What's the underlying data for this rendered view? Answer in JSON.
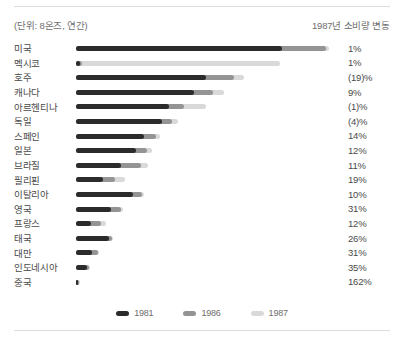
{
  "header": {
    "unit_note": "(단위: 8온즈, 연간)",
    "change_note": "1987년 소비량 변동"
  },
  "legend": {
    "items": [
      {
        "label": "1981",
        "color": "#2b2b2b"
      },
      {
        "label": "1986",
        "color": "#949494"
      },
      {
        "label": "1987",
        "color": "#d9d9d9"
      }
    ]
  },
  "chart_data": {
    "type": "bar",
    "orientation": "horizontal",
    "title": "",
    "subtitle": "(단위: 8온즈, 연간)",
    "xlabel": "",
    "ylabel": "",
    "grid": false,
    "legend_position": "bottom-center",
    "series_names": [
      "1981",
      "1986",
      "1987"
    ],
    "series_colors": [
      "#2b2b2b",
      "#949494",
      "#d9d9d9"
    ],
    "value_column_header": "1987년 소비량 변동",
    "categories": [
      "미국",
      "멕시코",
      "호주",
      "캐나다",
      "아르헨티나",
      "독일",
      "스페인",
      "일본",
      "브라질",
      "필리핀",
      "이탈리아",
      "영국",
      "프랑스",
      "태국",
      "대만",
      "인도네시아",
      "중국"
    ],
    "series": [
      {
        "name": "1981",
        "values": [
          206,
          4,
          130,
          118,
          93,
          86,
          68,
          60,
          45,
          27,
          57,
          35,
          15,
          33,
          16,
          11,
          2
        ]
      },
      {
        "name": "1986",
        "values": [
          250,
          6,
          158,
          137,
          108,
          96,
          80,
          71,
          65,
          39,
          66,
          45,
          25,
          36,
          22,
          13,
          3
        ]
      },
      {
        "name": "1987",
        "values": [
          253,
          204,
          168,
          148,
          130,
          102,
          84,
          76,
          72,
          49,
          68,
          47,
          30,
          37,
          23,
          14,
          4
        ]
      }
    ],
    "bar_pixel_widths": [
      {
        "category": "미국",
        "y1981": 206,
        "y1986": 250,
        "y1987": 253
      },
      {
        "category": "멕시코",
        "y1981": 4,
        "y1986": 6,
        "y1987": 204
      },
      {
        "category": "호주",
        "y1981": 130,
        "y1986": 158,
        "y1987": 168
      },
      {
        "category": "캐나다",
        "y1981": 118,
        "y1986": 137,
        "y1987": 148
      },
      {
        "category": "아르헨티나",
        "y1981": 93,
        "y1986": 108,
        "y1987": 130
      },
      {
        "category": "독일",
        "y1981": 86,
        "y1986": 96,
        "y1987": 102
      },
      {
        "category": "스페인",
        "y1981": 68,
        "y1986": 80,
        "y1987": 84
      },
      {
        "category": "일본",
        "y1981": 60,
        "y1986": 71,
        "y1987": 76
      },
      {
        "category": "브라질",
        "y1981": 45,
        "y1986": 65,
        "y1987": 72
      },
      {
        "category": "필리핀",
        "y1981": 27,
        "y1986": 39,
        "y1987": 49
      },
      {
        "category": "이탈리아",
        "y1981": 57,
        "y1986": 66,
        "y1987": 68
      },
      {
        "category": "영국",
        "y1981": 35,
        "y1986": 45,
        "y1987": 47
      },
      {
        "category": "프랑스",
        "y1981": 15,
        "y1986": 25,
        "y1987": 30
      },
      {
        "category": "태국",
        "y1981": 33,
        "y1986": 36,
        "y1987": 37
      },
      {
        "category": "대만",
        "y1981": 16,
        "y1986": 22,
        "y1987": 23
      },
      {
        "category": "인도네시아",
        "y1981": 11,
        "y1986": 13,
        "y1987": 14
      },
      {
        "category": "중국",
        "y1981": 2,
        "y1986": 3,
        "y1987": 4
      }
    ],
    "change_1987": [
      "1%",
      "1%",
      "(19)%",
      "9%",
      "(1)%",
      "(4)%",
      "14%",
      "12%",
      "11%",
      "19%",
      "10%",
      "31%",
      "12%",
      "26%",
      "31%",
      "35%",
      "162%"
    ]
  },
  "rows": [
    {
      "label": "미국",
      "pct": "1%",
      "w1981": 206,
      "w1986": 250,
      "w1987": 253
    },
    {
      "label": "멕시코",
      "pct": "1%",
      "w1981": 4,
      "w1986": 6,
      "w1987": 204
    },
    {
      "label": "호주",
      "pct": "(19)%",
      "w1981": 130,
      "w1986": 158,
      "w1987": 168
    },
    {
      "label": "캐나다",
      "pct": "9%",
      "w1981": 118,
      "w1986": 137,
      "w1987": 148
    },
    {
      "label": "아르헨티나",
      "pct": "(1)%",
      "w1981": 93,
      "w1986": 108,
      "w1987": 130
    },
    {
      "label": "독일",
      "pct": "(4)%",
      "w1981": 86,
      "w1986": 96,
      "w1987": 102
    },
    {
      "label": "스페인",
      "pct": "14%",
      "w1981": 68,
      "w1986": 80,
      "w1987": 84
    },
    {
      "label": "일본",
      "pct": "12%",
      "w1981": 60,
      "w1986": 71,
      "w1987": 76
    },
    {
      "label": "브라질",
      "pct": "11%",
      "w1981": 45,
      "w1986": 65,
      "w1987": 72
    },
    {
      "label": "필리핀",
      "pct": "19%",
      "w1981": 27,
      "w1986": 39,
      "w1987": 49
    },
    {
      "label": "이탈리아",
      "pct": "10%",
      "w1981": 57,
      "w1986": 66,
      "w1987": 68
    },
    {
      "label": "영국",
      "pct": "31%",
      "w1981": 35,
      "w1986": 45,
      "w1987": 47
    },
    {
      "label": "프랑스",
      "pct": "12%",
      "w1981": 15,
      "w1986": 25,
      "w1987": 30
    },
    {
      "label": "태국",
      "pct": "26%",
      "w1981": 33,
      "w1986": 36,
      "w1987": 37
    },
    {
      "label": "대만",
      "pct": "31%",
      "w1981": 16,
      "w1986": 22,
      "w1987": 23
    },
    {
      "label": "인도네시아",
      "pct": "35%",
      "w1981": 11,
      "w1986": 13,
      "w1987": 14
    },
    {
      "label": "중국",
      "pct": "162%",
      "w1981": 2,
      "w1986": 3,
      "w1987": 4
    }
  ]
}
